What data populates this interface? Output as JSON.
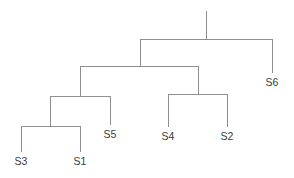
{
  "figure": {
    "kind": "dendrogram",
    "background_color": "#ffffff",
    "line_color": "#8f8f8f",
    "label_color": "#3a3a3a",
    "line_width": 1,
    "width": 294,
    "height": 178
  },
  "labels": {
    "s3": "S3",
    "s1": "S1",
    "s5": "S5",
    "s4": "S4",
    "s2": "S2",
    "s6": "S6"
  },
  "chart_data": {
    "type": "line",
    "title": "",
    "xlabel": "",
    "ylabel": "",
    "orientation": "top-down",
    "leaf_order": [
      "S3",
      "S1",
      "S5",
      "S4",
      "S2",
      "S6"
    ],
    "leaves": [
      {
        "name": "S3",
        "x": 21,
        "tip_y": 152,
        "label_x": 21,
        "label_y": 155
      },
      {
        "name": "S1",
        "x": 80,
        "tip_y": 152,
        "label_x": 80,
        "label_y": 155
      },
      {
        "name": "S5",
        "x": 110,
        "tip_y": 125,
        "label_x": 110,
        "label_y": 128
      },
      {
        "name": "S4",
        "x": 168,
        "tip_y": 127,
        "label_x": 168,
        "label_y": 130
      },
      {
        "name": "S2",
        "x": 227,
        "tip_y": 127,
        "label_x": 227,
        "label_y": 130
      },
      {
        "name": "S6",
        "x": 272,
        "tip_y": 73,
        "label_x": 272,
        "label_y": 76
      }
    ],
    "merges": [
      {
        "id": "m1",
        "label": "(S3, S1)",
        "members": [
          "S3",
          "S1"
        ],
        "height_y": 126,
        "left_x": 21,
        "right_x": 80,
        "center_x": 50,
        "left_child_y": 152,
        "right_child_y": 152
      },
      {
        "id": "m2",
        "label": "((S3, S1), S5)",
        "members": [
          "S3",
          "S1",
          "S5"
        ],
        "height_y": 96,
        "left_x": 50,
        "right_x": 110,
        "center_x": 80,
        "left_child_y": 126,
        "right_child_y": 125
      },
      {
        "id": "m3",
        "label": "(S4, S2)",
        "members": [
          "S4",
          "S2"
        ],
        "height_y": 94,
        "left_x": 168,
        "right_x": 227,
        "center_x": 198,
        "left_child_y": 127,
        "right_child_y": 127
      },
      {
        "id": "m4",
        "label": "(((S3, S1), S5), (S4, S2))",
        "members": [
          "S3",
          "S1",
          "S5",
          "S4",
          "S2"
        ],
        "height_y": 66,
        "left_x": 80,
        "right_x": 198,
        "center_x": 140,
        "left_child_y": 96,
        "right_child_y": 94
      },
      {
        "id": "m5",
        "label": "root",
        "members": [
          "S3",
          "S1",
          "S5",
          "S4",
          "S2",
          "S6"
        ],
        "height_y": 39,
        "left_x": 140,
        "right_x": 272,
        "center_x": 206,
        "left_child_y": 66,
        "right_child_y": 73
      }
    ],
    "root_stem": {
      "x": 206,
      "from_y": 39,
      "to_y": 11
    }
  }
}
